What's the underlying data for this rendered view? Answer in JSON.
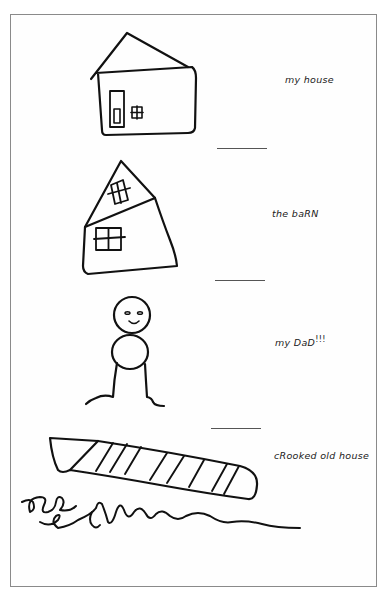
{
  "page": {
    "background": "#ffffff",
    "border_color": "#8a8a8a",
    "ink_color": "#111111"
  },
  "entries": [
    {
      "id": "my-house",
      "drawing": "house-icon",
      "label": "my house"
    },
    {
      "id": "the-barn",
      "drawing": "barn-icon",
      "label": "the baRN"
    },
    {
      "id": "my-dad",
      "drawing": "stick-figure-icon",
      "label": "my DaD",
      "suffix": "!!!"
    },
    {
      "id": "crooked-old-house",
      "drawing": "crooked-house-icon",
      "label": "cRooked old house"
    }
  ]
}
